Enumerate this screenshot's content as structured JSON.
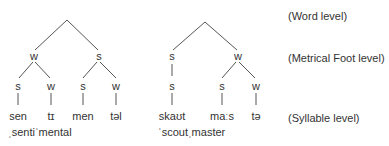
{
  "levels": {
    "word": "(Word level)",
    "foot": "(Metrical Foot level)",
    "syllable": "(Syllable level)"
  },
  "tree_left": {
    "word": "sentimental",
    "stressed_form": "ˌsentiˈmental",
    "foot": [
      "w",
      "s"
    ],
    "syllable_nodes": [
      "s",
      "w",
      "s",
      "w"
    ],
    "syllables": [
      "sen",
      "tɪ",
      "men",
      "təl"
    ]
  },
  "tree_right": {
    "word": "scoutmaster",
    "stressed_form": "ˈscoutˌmaster",
    "foot": [
      "s",
      "w"
    ],
    "syllable_nodes": [
      "s",
      "s",
      "w"
    ],
    "syllables": [
      "skaʊt",
      "maːs",
      "tə"
    ]
  },
  "colors": {
    "line": "#555555",
    "text": "#333333",
    "background": "#ffffff"
  }
}
